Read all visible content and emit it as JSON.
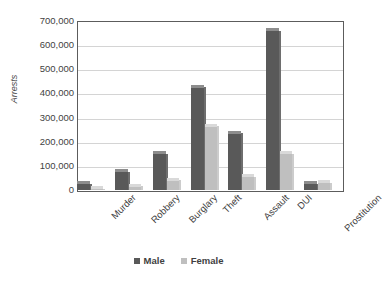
{
  "chart_data": {
    "type": "bar",
    "title": "",
    "xlabel": "",
    "ylabel": "Arrests",
    "categories": [
      "Murder",
      "Robbery",
      "Burglary",
      "Theft",
      "Assault",
      "DUI",
      "Prostitution"
    ],
    "series": [
      {
        "name": "Male",
        "color": "#595959",
        "values": [
          25000,
          75000,
          150000,
          425000,
          235000,
          660000,
          25000
        ]
      },
      {
        "name": "Female",
        "color": "#bfbfbf",
        "values": [
          5000,
          15000,
          40000,
          265000,
          55000,
          150000,
          30000
        ]
      }
    ],
    "ylim": [
      0,
      700000
    ],
    "y_ticks": [
      0,
      100000,
      200000,
      300000,
      400000,
      500000,
      600000,
      700000
    ],
    "y_tick_labels": [
      "0",
      "100,000",
      "200,000",
      "300,000",
      "400,000",
      "500,000",
      "600,000",
      "700,000"
    ],
    "grid": true,
    "legend_position": "bottom"
  }
}
